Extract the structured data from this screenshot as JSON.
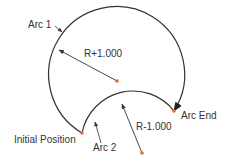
{
  "diagram": {
    "labels": {
      "arc1": "Arc 1",
      "r_plus": "R+1.000",
      "arc_end": "Arc End",
      "r_minus": "R-1.000",
      "initial_position": "Initial Position",
      "arc2": "Arc 2"
    },
    "colors": {
      "line": "#333333",
      "point": "#e0703a"
    }
  }
}
